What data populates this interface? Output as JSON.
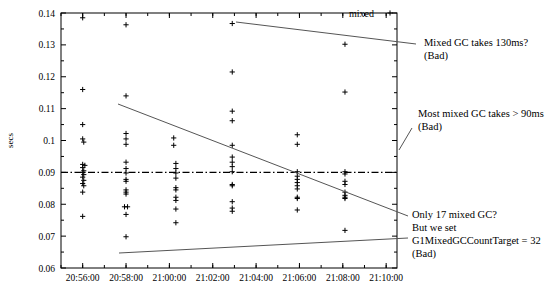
{
  "chart_data": {
    "type": "scatter",
    "title": "",
    "xlabel": "",
    "ylabel": "secs",
    "ylim": [
      0.06,
      0.14
    ],
    "xlim": [
      "20:55:00",
      "21:10:30"
    ],
    "grid": false,
    "legend": {
      "position": "top-right",
      "entries": [
        {
          "name": "mixed",
          "marker": "plus"
        }
      ]
    },
    "ytick_labels": [
      "0.06",
      "0.07",
      "0.08",
      "0.09",
      "0.1",
      "0.11",
      "0.12",
      "0.13",
      "0.14"
    ],
    "ytick_values": [
      0.06,
      0.07,
      0.08,
      0.09,
      0.1,
      0.11,
      0.12,
      0.13,
      0.14
    ],
    "xtick_labels": [
      "20:56:00",
      "20:58:00",
      "21:00:00",
      "21:02:00",
      "21:04:00",
      "21:06:00",
      "21:08:00",
      "21:10:00"
    ],
    "xtick_minutes": [
      56,
      58,
      60,
      62,
      64,
      66,
      68,
      70
    ],
    "reference_line": {
      "y": 0.09,
      "style": "dash-dot",
      "label": "0.09"
    },
    "series": [
      {
        "name": "mixed",
        "marker": "plus",
        "points": [
          [
            56.0,
            0.1385
          ],
          [
            56.0,
            0.116
          ],
          [
            56.0,
            0.105
          ],
          [
            56.0,
            0.1005
          ],
          [
            56.05,
            0.0995
          ],
          [
            56.0,
            0.0925
          ],
          [
            56.1,
            0.0922
          ],
          [
            56.0,
            0.0915
          ],
          [
            56.05,
            0.0905
          ],
          [
            56.0,
            0.09
          ],
          [
            56.05,
            0.0893
          ],
          [
            56.0,
            0.0885
          ],
          [
            56.05,
            0.0875
          ],
          [
            56.0,
            0.0865
          ],
          [
            56.05,
            0.0858
          ],
          [
            56.0,
            0.0838
          ],
          [
            56.0,
            0.0762
          ],
          [
            58.0,
            0.1363
          ],
          [
            58.0,
            0.114
          ],
          [
            58.0,
            0.1022
          ],
          [
            58.0,
            0.1005
          ],
          [
            58.0,
            0.0988
          ],
          [
            58.0,
            0.0932
          ],
          [
            58.0,
            0.0912
          ],
          [
            58.0,
            0.0898
          ],
          [
            58.0,
            0.0878
          ],
          [
            58.0,
            0.0872
          ],
          [
            58.0,
            0.0845
          ],
          [
            58.0,
            0.0838
          ],
          [
            58.0,
            0.0832
          ],
          [
            57.93,
            0.0792
          ],
          [
            58.07,
            0.0792
          ],
          [
            58.0,
            0.0768
          ],
          [
            58.0,
            0.0698
          ],
          [
            60.2,
            0.1008
          ],
          [
            60.2,
            0.0985
          ],
          [
            60.3,
            0.0928
          ],
          [
            60.3,
            0.0912
          ],
          [
            60.3,
            0.0898
          ],
          [
            60.3,
            0.0882
          ],
          [
            60.3,
            0.0852
          ],
          [
            60.3,
            0.0845
          ],
          [
            60.3,
            0.0822
          ],
          [
            60.3,
            0.0812
          ],
          [
            60.3,
            0.0785
          ],
          [
            60.3,
            0.0742
          ],
          [
            62.9,
            0.1367
          ],
          [
            62.9,
            0.1215
          ],
          [
            62.9,
            0.1092
          ],
          [
            62.9,
            0.1062
          ],
          [
            62.9,
            0.0985
          ],
          [
            62.9,
            0.0948
          ],
          [
            62.9,
            0.0932
          ],
          [
            62.9,
            0.0918
          ],
          [
            62.9,
            0.0902
          ],
          [
            62.9,
            0.0862
          ],
          [
            62.9,
            0.0858
          ],
          [
            62.9,
            0.0808
          ],
          [
            62.9,
            0.0788
          ],
          [
            62.9,
            0.0778
          ],
          [
            65.9,
            0.1018
          ],
          [
            65.9,
            0.0988
          ],
          [
            65.9,
            0.0902
          ],
          [
            65.9,
            0.0888
          ],
          [
            65.9,
            0.0878
          ],
          [
            65.9,
            0.0868
          ],
          [
            65.9,
            0.0858
          ],
          [
            65.9,
            0.0848
          ],
          [
            65.9,
            0.0822
          ],
          [
            65.9,
            0.0818
          ],
          [
            65.9,
            0.0782
          ],
          [
            68.1,
            0.1302
          ],
          [
            68.1,
            0.1152
          ],
          [
            68.1,
            0.0902
          ],
          [
            68.1,
            0.0895
          ],
          [
            68.1,
            0.0872
          ],
          [
            68.1,
            0.0862
          ],
          [
            68.1,
            0.0838
          ],
          [
            68.1,
            0.0828
          ],
          [
            68.1,
            0.0822
          ],
          [
            68.1,
            0.0818
          ],
          [
            68.1,
            0.0718
          ]
        ]
      }
    ],
    "annotations": [
      {
        "id": "anno-130ms",
        "lines": [
          "Mixed GC takes 130ms?",
          "(Bad)"
        ],
        "text_x": 424,
        "text_y": 46,
        "arrow_from": [
          416,
          44
        ],
        "arrow_to": [
          236,
          22
        ]
      },
      {
        "id": "anno-90ms",
        "lines": [
          "Most mixed GC takes > 90ms",
          "(Bad)"
        ],
        "text_x": 418,
        "text_y": 117,
        "arrow_from": [
          412,
          128
        ],
        "arrow_to": [
          399,
          150
        ]
      },
      {
        "id": "anno-17gc",
        "lines": [
          "Only 17 mixed GC?",
          "But we set",
          "G1MixedGCCountTarget = 32",
          "(Bad)"
        ],
        "text_x": 412,
        "text_y": 218,
        "arrow_from": [
          408,
          216
        ],
        "arrow_to": [
          118,
          104
        ]
      },
      {
        "id": "anno-lowest",
        "lines": [],
        "text_x": 0,
        "text_y": 0,
        "arrow_from": [
          408,
          238
        ],
        "arrow_to": [
          119,
          253
        ]
      }
    ]
  },
  "legend_label": "mixed",
  "y_axis_title": "secs"
}
